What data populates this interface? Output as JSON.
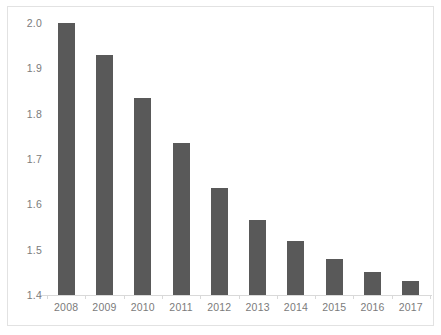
{
  "chart_data": {
    "type": "bar",
    "title": "",
    "subtitle": "",
    "xlabel": "",
    "ylabel": "",
    "categories": [
      "2008",
      "2009",
      "2010",
      "2011",
      "2012",
      "2013",
      "2014",
      "2015",
      "2016",
      "2017"
    ],
    "values": [
      2.0,
      1.93,
      1.835,
      1.735,
      1.635,
      1.565,
      1.52,
      1.48,
      1.45,
      1.43
    ],
    "series": [
      {
        "name": "",
        "values": [
          2.0,
          1.93,
          1.835,
          1.735,
          1.635,
          1.565,
          1.52,
          1.48,
          1.45,
          1.43
        ]
      }
    ],
    "ylim": [
      1.4,
      2.0
    ],
    "yticks": [
      1.4,
      1.5,
      1.6,
      1.7,
      1.8,
      1.9,
      2.0
    ],
    "ytick_labels": [
      "1.4",
      "1.5",
      "1.6",
      "1.7",
      "1.8",
      "1.9",
      "2.0"
    ],
    "xtick_labels": [
      "2008",
      "2009",
      "2010",
      "2011",
      "2012",
      "2013",
      "2014",
      "2015",
      "2016",
      "2017"
    ],
    "grid": false,
    "legend": false,
    "legend_position": "none",
    "annotations": [],
    "colors": {
      "bar": "#595959",
      "axis_line": "#d9d9d9",
      "tick_text": "#7b7b7b",
      "frame": "#e2e2e2",
      "background": "#ffffff"
    }
  }
}
